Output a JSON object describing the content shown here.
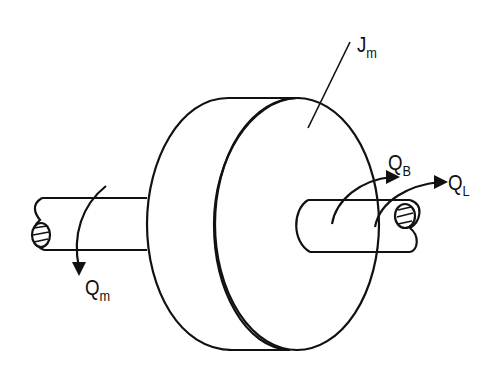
{
  "diagram": {
    "labels": {
      "inertia": {
        "main": "J",
        "sub": "m"
      },
      "motor_torque": {
        "main": "Q",
        "sub": "m"
      },
      "bearing_torque": {
        "main": "Q",
        "sub": "B"
      },
      "load_torque": {
        "main": "Q",
        "sub": "L"
      }
    },
    "stroke_color": "#111111"
  }
}
